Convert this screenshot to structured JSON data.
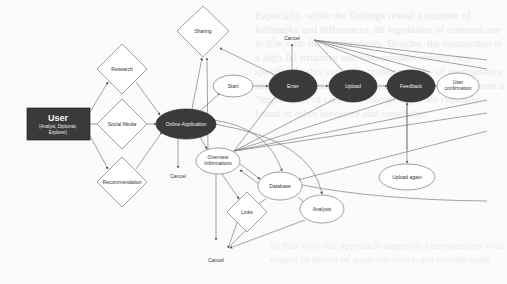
{
  "diagram": {
    "colors": {
      "background": "#fbfbfb",
      "dark_node": "#3a3a3a",
      "light_node": "#ffffff",
      "edge": "#666666"
    },
    "user_box": {
      "title": "User",
      "subtitle_line1": "(Analyst, Diplomat,",
      "subtitle_line2": "Explorer)"
    },
    "decisions": {
      "research": "Research",
      "social_media": "Social Media",
      "recommendation": "Recommendation",
      "sharing": "Sharing",
      "links": "Links"
    },
    "processes": {
      "online_application": "Online-Application",
      "start": "Start",
      "enter": "Enter",
      "upload": "Upload",
      "feedback": "Feedback",
      "user_confirmation_line1": "User",
      "user_confirmation_line2": "confirmation",
      "overview_line1": "Overview",
      "overview_line2": "Informations",
      "database": "Database",
      "analysis": "Analysis",
      "upload_again": "Upload again"
    },
    "terminals": {
      "cancel_top": "Cancel",
      "cancel_mid": "Cancel",
      "cancel_bottom": "Cancel"
    }
  }
}
